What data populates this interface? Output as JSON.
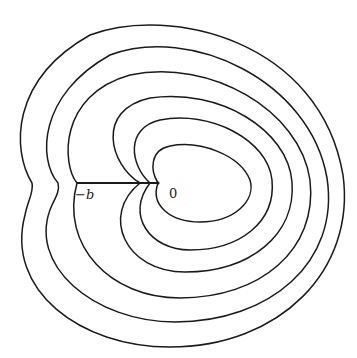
{
  "figure": {
    "type": "level-curves diagram",
    "labels": {
      "minus_b": "−b",
      "origin": "0"
    },
    "segment": {
      "from_label": "-b",
      "to_label": "0"
    },
    "curve_count": 6,
    "colors": {
      "stroke": "#1a1a1a",
      "background": "#ffffff"
    }
  }
}
